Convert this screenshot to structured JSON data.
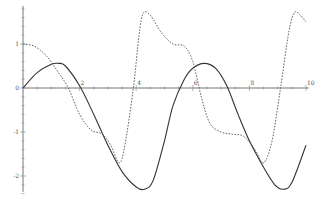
{
  "chart_data": {
    "type": "line",
    "title": "",
    "xlabel": "",
    "ylabel": "",
    "xlim": [
      0,
      10
    ],
    "ylim": [
      -2.5,
      2
    ],
    "grid": false,
    "legend": null,
    "x_ticks": [
      "2",
      "4",
      "6",
      "8",
      "10"
    ],
    "y_ticks": [
      "1",
      "0",
      "-1",
      "-2"
    ],
    "series": [
      {
        "name": "solid",
        "style": "solid",
        "color": "#333333",
        "x": [
          0,
          0.5,
          1.0,
          1.25,
          1.5,
          2.0,
          2.5,
          3.0,
          3.5,
          4.0,
          4.3,
          4.6,
          5.0,
          5.3,
          5.7,
          6.0,
          6.4,
          6.8,
          7.2,
          7.6,
          8.0,
          8.5,
          8.9,
          9.2,
          9.5,
          10.0
        ],
        "y": [
          0,
          0.35,
          0.54,
          0.56,
          0.5,
          0.05,
          -0.6,
          -1.3,
          -1.9,
          -2.25,
          -2.3,
          -2.1,
          -1.2,
          -0.4,
          0.2,
          0.45,
          0.56,
          0.45,
          0.05,
          -0.6,
          -1.2,
          -1.8,
          -2.2,
          -2.3,
          -2.15,
          -1.3
        ]
      },
      {
        "name": "dashed",
        "style": "dashed",
        "color": "#555555",
        "x": [
          0,
          0.4,
          0.8,
          1.2,
          1.6,
          2.0,
          2.4,
          2.8,
          3.1,
          3.4,
          3.6,
          3.9,
          4.1,
          4.25,
          4.5,
          4.9,
          5.3,
          5.7,
          6.0,
          6.3,
          6.6,
          7.0,
          7.4,
          7.8,
          8.2,
          8.5,
          8.8,
          9.1,
          9.4,
          9.6,
          9.8,
          10.0
        ],
        "y": [
          1.0,
          0.95,
          0.75,
          0.4,
          0.0,
          -0.6,
          -0.95,
          -1.05,
          -1.3,
          -1.7,
          -1.3,
          0.0,
          1.2,
          1.7,
          1.65,
          1.25,
          1.0,
          0.95,
          0.6,
          -0.2,
          -0.8,
          -1.0,
          -1.05,
          -1.1,
          -1.4,
          -1.7,
          -1.2,
          0.0,
          1.3,
          1.72,
          1.65,
          1.5
        ]
      }
    ]
  }
}
